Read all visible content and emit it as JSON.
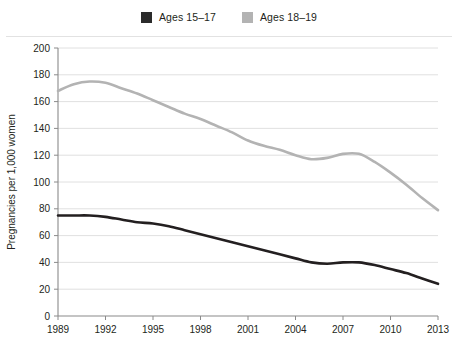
{
  "legend": {
    "position": "top-center",
    "items": [
      {
        "label": "Ages 15–17",
        "color": "#2b2b2b",
        "swatch_name": "legend-swatch-ages-15-17"
      },
      {
        "label": "Ages 18–19",
        "color": "#b3b3b3",
        "swatch_name": "legend-swatch-ages-18-19"
      }
    ]
  },
  "chart_data": {
    "type": "line",
    "title": "",
    "subtitle": "",
    "xlabel": "",
    "ylabel": "Pregnancies per 1,000 women",
    "xlim": [
      1989,
      2013
    ],
    "ylim": [
      0,
      200
    ],
    "ytick_step": 20,
    "yticks": [
      0,
      20,
      40,
      60,
      80,
      100,
      120,
      140,
      160,
      180,
      200
    ],
    "ytick_labels": [
      "0",
      "20",
      "40",
      "60",
      "80",
      "100",
      "120",
      "140",
      "160",
      "180",
      "200"
    ],
    "xticks": [
      1989,
      1992,
      1995,
      1998,
      2001,
      2004,
      2007,
      2010,
      2013
    ],
    "xtick_labels": [
      "1989",
      "1992",
      "1995",
      "1998",
      "2001",
      "2004",
      "2007",
      "2010",
      "2013"
    ],
    "x": [
      1989,
      1990,
      1991,
      1992,
      1993,
      1994,
      1995,
      1996,
      1997,
      1998,
      1999,
      2000,
      2001,
      2002,
      2003,
      2004,
      2005,
      2006,
      2007,
      2008,
      2009,
      2010,
      2011,
      2012,
      2013
    ],
    "grid": "horizontal",
    "legend_position": "top-center",
    "series": [
      {
        "name": "Ages 18–19",
        "color": "#b3b3b3",
        "values": [
          168,
          173,
          175,
          174,
          170,
          166,
          161,
          156,
          151,
          147,
          142,
          137,
          131,
          127,
          124,
          120,
          117,
          118,
          121,
          121,
          115,
          107,
          98,
          88,
          79
        ]
      },
      {
        "name": "Ages 15–17",
        "color": "#231f20",
        "values": [
          75,
          75,
          75,
          74,
          72,
          70,
          69,
          67,
          64,
          61,
          58,
          55,
          52,
          49,
          46,
          43,
          40,
          39,
          40,
          40,
          38,
          35,
          32,
          28,
          24
        ]
      }
    ]
  },
  "axes": {
    "y_axis_line_color": "#8a8a8a",
    "x_axis_line_color": "#8a8a8a",
    "gridline_color": "#dcdcdc"
  }
}
